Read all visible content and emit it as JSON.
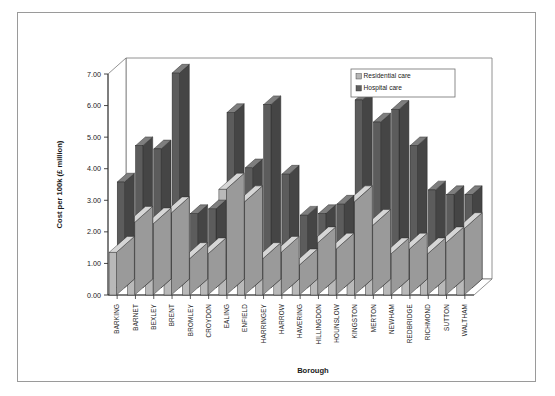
{
  "chart_data": {
    "type": "bar",
    "title": "",
    "subtitle": "",
    "xlabel": "Borough",
    "ylabel": "Cost per 100k (£ million)",
    "ylim": [
      0,
      7
    ],
    "ytick_step": 1,
    "ytick_labels": [
      "0.00",
      "1.00",
      "2.00",
      "3.00",
      "4.00",
      "5.00",
      "6.00",
      "7.00"
    ],
    "grid": false,
    "three_d": true,
    "legend_position": "top-right",
    "categories": [
      "BARKING",
      "BARNET",
      "BEXLEY",
      "BRENT",
      "BROMLEY",
      "CROYDON",
      "EALING",
      "ENFIELD",
      "HARRINGEY",
      "HARROW",
      "HAVERING",
      "HILLINGDON",
      "HOUNSLOW",
      "KINGSTON",
      "MERTON",
      "NEWHAM",
      "REDBRIDGE",
      "RICHMOND",
      "SUTTON",
      "WALTHAM"
    ],
    "series": [
      {
        "name": "Residential care",
        "color": "#b6b6b6",
        "values": [
          1.35,
          2.3,
          2.25,
          2.6,
          1.15,
          1.3,
          3.35,
          2.95,
          1.15,
          1.35,
          0.95,
          1.65,
          1.45,
          2.95,
          2.2,
          1.3,
          1.45,
          1.3,
          1.65,
          2.1
        ]
      },
      {
        "name": "Hospital care",
        "color": "#5e5e5e",
        "values": [
          3.35,
          4.5,
          4.4,
          6.8,
          2.35,
          2.5,
          5.55,
          3.8,
          5.8,
          3.6,
          2.3,
          2.35,
          2.65,
          5.95,
          5.25,
          5.65,
          4.5,
          3.1,
          2.95,
          2.95
        ]
      }
    ]
  },
  "legend": {
    "items": [
      {
        "label": "Residential care",
        "swatch": "#b6b6b6"
      },
      {
        "label": "Hospital care",
        "swatch": "#5e5e5e"
      }
    ]
  },
  "axes": {
    "x_title": "Borough",
    "y_title": "Cost per 100k (£ million)"
  }
}
